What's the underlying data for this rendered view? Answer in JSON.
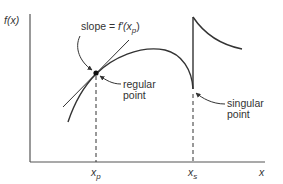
{
  "diagram": {
    "axes": {
      "y_label": "f(x)",
      "x_label": "x",
      "ticks": [
        {
          "label": "x",
          "subscript": "p"
        },
        {
          "label": "x",
          "subscript": "s"
        }
      ]
    },
    "annotations": {
      "slope_label_prefix": "slope = ",
      "slope_label_func": "f′(x",
      "slope_label_sub": "p",
      "slope_label_suffix": ")",
      "regular_line1": "regular",
      "regular_line2": "point",
      "singular_line1": "singular",
      "singular_line2": "point"
    },
    "colors": {
      "stroke": "#333333",
      "background": "#ffffff"
    }
  }
}
